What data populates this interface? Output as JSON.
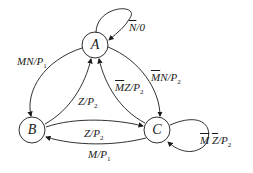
{
  "diagram": {
    "type": "state-diagram",
    "nodes": [
      {
        "id": "A",
        "label": "A"
      },
      {
        "id": "B",
        "label": "B"
      },
      {
        "id": "C",
        "label": "C"
      }
    ],
    "edges": [
      {
        "from": "A",
        "to": "A",
        "label": "N̄/0"
      },
      {
        "from": "A",
        "to": "B",
        "label": "MN/P1"
      },
      {
        "from": "B",
        "to": "A",
        "label": "Z/P2"
      },
      {
        "from": "A",
        "to": "C",
        "label": "M̄N/P2"
      },
      {
        "from": "C",
        "to": "A",
        "label": "M̄Z/P2"
      },
      {
        "from": "B",
        "to": "C",
        "label": "Z/P2"
      },
      {
        "from": "C",
        "to": "B",
        "label": "M/P1"
      },
      {
        "from": "C",
        "to": "C",
        "label": "M̄ Z̄/P2"
      }
    ],
    "labels": {
      "self_a_bar": "N",
      "self_a_rest": "/0",
      "ab_main": "MN/P",
      "ab_sub": "1",
      "ba_main": "Z/P",
      "ba_sub": "2",
      "ac_bar": "M",
      "ac_main": "N/P",
      "ac_sub": "2",
      "ca_bar": "M",
      "ca_main": "Z/P",
      "ca_sub": "2",
      "bc_main": "Z/P",
      "bc_sub": "2",
      "cb_main": "M/P",
      "cb_sub": "1",
      "self_c_bar1": "M",
      "self_c_bar2": "Z",
      "self_c_main": "/P",
      "self_c_sub": "2"
    }
  }
}
